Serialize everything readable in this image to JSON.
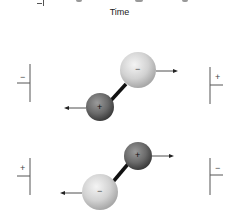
{
  "diagram": {
    "axis_label": "Time",
    "top_partial": {
      "symbol": "−"
    },
    "panel_1": {
      "left_plate": {
        "sign": "−"
      },
      "right_plate": {
        "sign": "+"
      },
      "large_sphere": {
        "sign": "−",
        "color": "#d4d4d4"
      },
      "small_sphere": {
        "sign": "+",
        "color": "#6f6f6f"
      },
      "large_arrow": "right",
      "small_arrow": "left"
    },
    "panel_2": {
      "left_plate": {
        "sign": "+"
      },
      "right_plate": {
        "sign": "−"
      },
      "large_sphere": {
        "sign": "−",
        "color": "#d4d4d4"
      },
      "small_sphere": {
        "sign": "+",
        "color": "#6f6f6f"
      },
      "large_arrow": "left",
      "small_arrow": "right"
    }
  }
}
